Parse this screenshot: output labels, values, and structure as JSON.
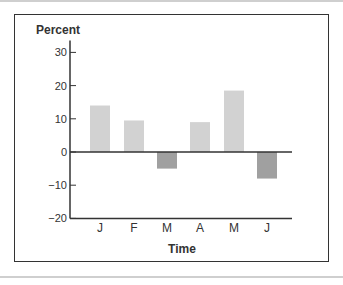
{
  "chart_data": {
    "type": "bar",
    "title": "",
    "xlabel": "Time",
    "ylabel": "Percent",
    "categories": [
      "J",
      "F",
      "M",
      "A",
      "M",
      "J"
    ],
    "values": [
      14,
      9.5,
      -5,
      9,
      18.5,
      -8
    ],
    "ylim": [
      -20,
      30
    ],
    "yticks": [
      30,
      20,
      10,
      0,
      -10,
      -20
    ],
    "ytick_labels": [
      "30",
      "20",
      "10",
      "0",
      "−10",
      "−20"
    ],
    "grid": false,
    "legend": null,
    "colors": {
      "positive": "#d2d2d2",
      "negative": "#a0a0a0",
      "axis": "#333333"
    }
  }
}
